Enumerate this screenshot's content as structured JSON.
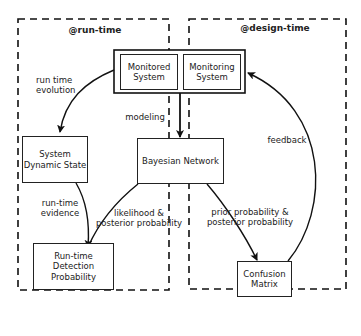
{
  "regions": {
    "runtime": "@run-time",
    "designtime": "@design-time"
  },
  "nodes": {
    "monitored_system": "Monitored System",
    "monitoring_system": "Monitoring System",
    "bayesian_network": "Bayesian Network",
    "system_dynamic_state": "System Dynamic State",
    "runtime_detection_probability": "Run-time Detection Probability",
    "confusion_matrix": "Confusion Matrix"
  },
  "edges": {
    "run_time_evolution": "run time evolution",
    "modeling": "modeling",
    "run_time_evidence": "run-time evidence",
    "likelihood_posterior": "likelihood & posterior probability",
    "prior_posterior": "prior probability & posterior probability",
    "feedback": "feedback"
  }
}
